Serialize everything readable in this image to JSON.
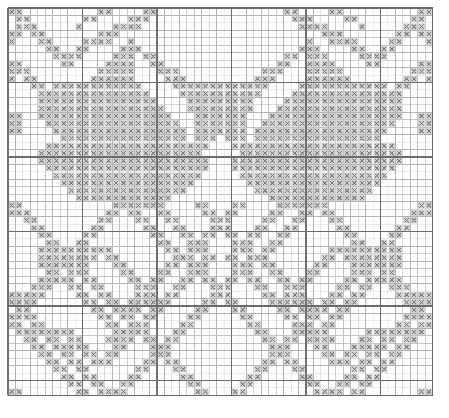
{
  "document": {
    "title": "Counted Cross-Stitch Pattern Chart",
    "type": "filet / cross-stitch grid chart",
    "description": "Monochrome symmetric cross-stitch chart of interlocking diamond and star motifs"
  },
  "grid": {
    "columns": 57,
    "rows": 52,
    "cell_size_px": 7.45,
    "origin_x_px": 8,
    "origin_y_px": 8,
    "heavy_line_every": 10,
    "light_line_color": "#b4b4b4",
    "heavy_line_color": "#6b6b6b",
    "background_color": "#ffffff",
    "stitch_symbol": "x",
    "stitch_symbol_name": "cross-stitch-x-mark",
    "stitch_color": "#7a7a7a",
    "stitch_fill_color": "#c8c8c8"
  },
  "legend": {
    "symbol_label": "x",
    "symbol_meaning": "filled stitch"
  },
  "chart_data": {
    "type": "heatmap",
    "xlabel": "",
    "ylabel": "",
    "grid": true,
    "legend_position": "none",
    "categories": [],
    "values": [],
    "note": "cells listed as run-length encoded filled spans per row: [startCol, length]",
    "rows": [
      {
        "r": 0,
        "spans": [
          [
            12,
            2
          ],
          [
            37,
            2
          ],
          [
            55,
            1
          ],
          [
            56,
            1
          ]
        ]
      },
      {
        "r": 1,
        "spans": [
          [
            10,
            2
          ],
          [
            38,
            2
          ],
          [
            40,
            1
          ],
          [
            54,
            2
          ]
        ]
      },
      {
        "r": 2,
        "spans": [
          [
            1,
            1
          ],
          [
            9,
            1
          ],
          [
            39,
            2
          ],
          [
            41,
            2
          ],
          [
            53,
            2
          ]
        ]
      },
      {
        "r": 3,
        "spans": [
          [
            0,
            2
          ],
          [
            42,
            2
          ],
          [
            44,
            1
          ],
          [
            52,
            2
          ]
        ]
      },
      {
        "r": 4,
        "spans": [
          [
            0,
            1
          ],
          [
            16,
            1
          ],
          [
            43,
            2
          ],
          [
            45,
            2
          ],
          [
            51,
            2
          ]
        ]
      },
      {
        "r": 5,
        "spans": [
          [
            15,
            2
          ],
          [
            17,
            1
          ],
          [
            46,
            2
          ],
          [
            50,
            2
          ]
        ]
      },
      {
        "r": 6,
        "spans": [
          [
            14,
            3
          ],
          [
            18,
            2
          ],
          [
            47,
            4
          ]
        ]
      },
      {
        "r": 7,
        "spans": [
          [
            13,
            4
          ],
          [
            19,
            2
          ],
          [
            48,
            2
          ],
          [
            55,
            2
          ]
        ]
      },
      {
        "r": 8,
        "spans": [
          [
            12,
            5
          ],
          [
            20,
            3
          ],
          [
            54,
            3
          ]
        ]
      },
      {
        "r": 9,
        "spans": [
          [
            11,
            6
          ],
          [
            21,
            3
          ],
          [
            53,
            2
          ],
          [
            56,
            1
          ]
        ]
      },
      {
        "r": 10,
        "spans": [
          [
            6,
            4
          ],
          [
            10,
            8
          ],
          [
            22,
            3
          ],
          [
            26,
            8
          ],
          [
            52,
            2
          ]
        ]
      },
      {
        "r": 11,
        "spans": [
          [
            5,
            14
          ],
          [
            23,
            10
          ],
          [
            51,
            2
          ]
        ]
      },
      {
        "r": 12,
        "spans": [
          [
            4,
            16
          ],
          [
            24,
            9
          ],
          [
            50,
            2
          ]
        ]
      },
      {
        "r": 13,
        "spans": [
          [
            4,
            17
          ],
          [
            25,
            8
          ],
          [
            49,
            2
          ]
        ]
      },
      {
        "r": 14,
        "spans": [
          [
            0,
            2
          ],
          [
            4,
            18
          ],
          [
            26,
            6
          ],
          [
            48,
            2
          ]
        ]
      },
      {
        "r": 15,
        "spans": [
          [
            0,
            2
          ],
          [
            5,
            18
          ],
          [
            27,
            5
          ],
          [
            47,
            2
          ]
        ]
      },
      {
        "r": 16,
        "spans": [
          [
            0,
            2
          ],
          [
            6,
            18
          ],
          [
            28,
            4
          ],
          [
            46,
            2
          ]
        ]
      },
      {
        "r": 17,
        "spans": [
          [
            7,
            17
          ],
          [
            29,
            3
          ],
          [
            45,
            2
          ]
        ]
      },
      {
        "r": 18,
        "spans": [
          [
            5,
            20
          ],
          [
            30,
            2
          ],
          [
            44,
            2
          ]
        ]
      },
      {
        "r": 19,
        "spans": [
          [
            4,
            22
          ],
          [
            31,
            2
          ],
          [
            43,
            2
          ]
        ]
      },
      {
        "r": 20,
        "spans": [
          [
            4,
            23
          ],
          [
            32,
            2
          ],
          [
            42,
            2
          ]
        ]
      },
      {
        "r": 21,
        "spans": [
          [
            5,
            22
          ],
          [
            33,
            2
          ],
          [
            41,
            2
          ]
        ]
      },
      {
        "r": 22,
        "spans": [
          [
            6,
            20
          ],
          [
            34,
            2
          ],
          [
            40,
            2
          ]
        ]
      },
      {
        "r": 23,
        "spans": [
          [
            7,
            18
          ],
          [
            35,
            6
          ]
        ]
      },
      {
        "r": 24,
        "spans": [
          [
            8,
            16
          ],
          [
            36,
            4
          ]
        ]
      },
      {
        "r": 25,
        "spans": [
          [
            9,
            13
          ],
          [
            37,
            2
          ]
        ]
      },
      {
        "r": 26,
        "spans": [
          [
            0,
            2
          ],
          [
            14,
            5
          ],
          [
            30,
            2
          ],
          [
            36,
            2
          ],
          [
            55,
            2
          ]
        ]
      },
      {
        "r": 27,
        "spans": [
          [
            0,
            2
          ],
          [
            13,
            2
          ],
          [
            16,
            2
          ],
          [
            29,
            2
          ],
          [
            35,
            2
          ],
          [
            54,
            2
          ]
        ]
      },
      {
        "r": 28,
        "spans": [
          [
            2,
            2
          ],
          [
            12,
            2
          ],
          [
            17,
            2
          ],
          [
            28,
            2
          ],
          [
            34,
            2
          ],
          [
            53,
            2
          ]
        ]
      },
      {
        "r": 29,
        "spans": [
          [
            3,
            2
          ],
          [
            11,
            2
          ],
          [
            18,
            2
          ],
          [
            27,
            2
          ],
          [
            33,
            2
          ],
          [
            52,
            2
          ]
        ]
      },
      {
        "r": 30,
        "spans": [
          [
            4,
            2
          ],
          [
            10,
            2
          ],
          [
            19,
            2
          ],
          [
            26,
            2
          ],
          [
            32,
            2
          ],
          [
            51,
            2
          ]
        ]
      },
      {
        "r": 31,
        "spans": [
          [
            5,
            2
          ],
          [
            9,
            2
          ],
          [
            20,
            2
          ],
          [
            25,
            2
          ],
          [
            31,
            2
          ],
          [
            50,
            2
          ]
        ]
      },
      {
        "r": 32,
        "spans": [
          [
            6,
            4
          ],
          [
            21,
            2
          ],
          [
            24,
            2
          ],
          [
            30,
            2
          ],
          [
            43,
            10
          ],
          [
            49,
            2
          ]
        ]
      },
      {
        "r": 33,
        "spans": [
          [
            7,
            2
          ],
          [
            22,
            3
          ],
          [
            29,
            2
          ],
          [
            42,
            2
          ],
          [
            45,
            8
          ],
          [
            48,
            2
          ]
        ]
      },
      {
        "r": 34,
        "spans": [
          [
            6,
            4
          ],
          [
            21,
            2
          ],
          [
            24,
            2
          ],
          [
            30,
            2
          ],
          [
            41,
            2
          ],
          [
            46,
            2
          ],
          [
            49,
            4
          ]
        ]
      },
      {
        "r": 35,
        "spans": [
          [
            5,
            2
          ],
          [
            9,
            2
          ],
          [
            20,
            2
          ],
          [
            25,
            2
          ],
          [
            31,
            2
          ],
          [
            40,
            2
          ],
          [
            47,
            2
          ],
          [
            50,
            2
          ]
        ]
      },
      {
        "r": 36,
        "spans": [
          [
            4,
            2
          ],
          [
            10,
            2
          ],
          [
            19,
            2
          ],
          [
            26,
            2
          ],
          [
            32,
            2
          ],
          [
            39,
            2
          ],
          [
            48,
            4
          ]
        ]
      },
      {
        "r": 37,
        "spans": [
          [
            3,
            2
          ],
          [
            11,
            2
          ],
          [
            18,
            2
          ],
          [
            27,
            2
          ],
          [
            33,
            2
          ],
          [
            38,
            2
          ],
          [
            47,
            2
          ],
          [
            51,
            2
          ]
        ]
      },
      {
        "r": 38,
        "spans": [
          [
            0,
            2
          ],
          [
            2,
            2
          ],
          [
            12,
            2
          ],
          [
            17,
            2
          ],
          [
            28,
            2
          ],
          [
            34,
            2
          ],
          [
            37,
            2
          ],
          [
            46,
            2
          ],
          [
            52,
            2
          ]
        ]
      },
      {
        "r": 39,
        "spans": [
          [
            0,
            2
          ],
          [
            13,
            2
          ],
          [
            16,
            2
          ],
          [
            29,
            2
          ],
          [
            35,
            4
          ],
          [
            45,
            2
          ],
          [
            53,
            2
          ]
        ]
      },
      {
        "r": 40,
        "spans": [
          [
            1,
            2
          ],
          [
            14,
            4
          ],
          [
            30,
            2
          ],
          [
            36,
            2
          ],
          [
            44,
            2
          ],
          [
            54,
            2
          ]
        ]
      },
      {
        "r": 41,
        "spans": [
          [
            2,
            2
          ],
          [
            15,
            2
          ],
          [
            31,
            2
          ],
          [
            37,
            2
          ],
          [
            43,
            2
          ],
          [
            55,
            2
          ]
        ]
      },
      {
        "r": 42,
        "spans": [
          [
            3,
            2
          ],
          [
            16,
            2
          ],
          [
            32,
            2
          ],
          [
            38,
            2
          ],
          [
            42,
            2
          ],
          [
            55,
            2
          ]
        ]
      },
      {
        "r": 43,
        "spans": [
          [
            4,
            2
          ],
          [
            17,
            2
          ],
          [
            33,
            2
          ],
          [
            39,
            4
          ],
          [
            48,
            8
          ],
          [
            54,
            2
          ]
        ]
      },
      {
        "r": 44,
        "spans": [
          [
            5,
            2
          ],
          [
            18,
            2
          ],
          [
            34,
            2
          ],
          [
            40,
            4
          ],
          [
            47,
            2
          ],
          [
            53,
            2
          ]
        ]
      },
      {
        "r": 45,
        "spans": [
          [
            6,
            4
          ],
          [
            19,
            2
          ],
          [
            35,
            2
          ],
          [
            41,
            2
          ],
          [
            46,
            2
          ],
          [
            52,
            2
          ]
        ]
      },
      {
        "r": 46,
        "spans": [
          [
            7,
            2
          ],
          [
            20,
            2
          ],
          [
            36,
            2
          ],
          [
            42,
            2
          ],
          [
            45,
            2
          ],
          [
            51,
            2
          ]
        ]
      },
      {
        "r": 47,
        "spans": [
          [
            8,
            2
          ],
          [
            21,
            2
          ],
          [
            37,
            2
          ],
          [
            43,
            2
          ],
          [
            44,
            2
          ],
          [
            50,
            2
          ]
        ]
      },
      {
        "r": 48,
        "spans": [
          [
            9,
            2
          ],
          [
            22,
            2
          ],
          [
            38,
            2
          ],
          [
            49,
            2
          ]
        ]
      },
      {
        "r": 49,
        "spans": [
          [
            10,
            2
          ],
          [
            23,
            2
          ],
          [
            39,
            2
          ],
          [
            48,
            2
          ]
        ]
      },
      {
        "r": 50,
        "spans": [
          [
            11,
            2
          ],
          [
            24,
            2
          ],
          [
            40,
            2
          ],
          [
            47,
            2
          ]
        ]
      },
      {
        "r": 51,
        "spans": [
          [
            0,
            2
          ],
          [
            12,
            2
          ],
          [
            25,
            2
          ],
          [
            41,
            2
          ],
          [
            46,
            2
          ],
          [
            55,
            2
          ]
        ]
      }
    ]
  }
}
